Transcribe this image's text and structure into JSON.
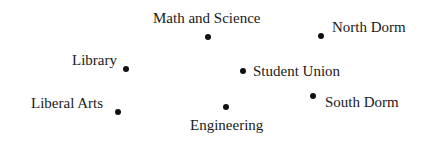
{
  "diagram": {
    "type": "campus-location-map",
    "locations": [
      {
        "name": "Math and Science",
        "dot": {
          "x": 208,
          "y": 37
        },
        "label": {
          "x": 153,
          "y": 11
        }
      },
      {
        "name": "North Dorm",
        "dot": {
          "x": 321,
          "y": 36
        },
        "label": {
          "x": 332,
          "y": 20
        }
      },
      {
        "name": "Library",
        "dot": {
          "x": 126,
          "y": 69
        },
        "label": {
          "x": 72,
          "y": 53
        }
      },
      {
        "name": "Student Union",
        "dot": {
          "x": 243,
          "y": 71
        },
        "label": {
          "x": 253,
          "y": 64
        }
      },
      {
        "name": "Liberal Arts",
        "dot": {
          "x": 118,
          "y": 112
        },
        "label": {
          "x": 31,
          "y": 96
        }
      },
      {
        "name": "Engineering",
        "dot": {
          "x": 226,
          "y": 107
        },
        "label": {
          "x": 190,
          "y": 118
        }
      },
      {
        "name": "South Dorm",
        "dot": {
          "x": 313,
          "y": 96
        },
        "label": {
          "x": 325,
          "y": 95
        }
      }
    ]
  }
}
